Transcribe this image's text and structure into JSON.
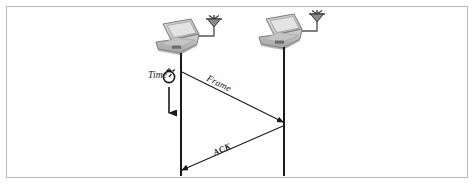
{
  "figure": {
    "kind": "sequence-diagram",
    "border_color": "#b9b9b9",
    "background": "#ffffff",
    "line_color": "#1a1a1a"
  },
  "nodes": [
    {
      "id": "station-left",
      "icon": "laptop-icon",
      "antenna_icon": "antenna-icon",
      "x": 181,
      "timeline_top": 62,
      "timeline_bottom": 175
    },
    {
      "id": "station-right",
      "icon": "laptop-icon",
      "antenna_icon": "antenna-icon",
      "x": 284,
      "timeline_top": 56,
      "timeline_bottom": 175
    }
  ],
  "axis": {
    "label": "Time",
    "icon": "stopwatch-icon",
    "direction": "down",
    "arrow_from_y": 86,
    "arrow_to_y": 120
  },
  "messages": [
    {
      "label": "Frame",
      "from": "station-left",
      "to": "station-right",
      "from_y": 72,
      "to_y": 122,
      "arrowhead": "filled"
    },
    {
      "label": "ACK",
      "from": "station-right",
      "to": "station-left",
      "from_y": 126,
      "to_y": 170,
      "arrowhead": "filled"
    }
  ],
  "colors": {
    "ink": "#1a1a1a",
    "border": "#b9b9b9",
    "laptop_body": "#c9c9c9",
    "laptop_screen": "#dedede",
    "laptop_shadow": "#8f8f8f"
  }
}
